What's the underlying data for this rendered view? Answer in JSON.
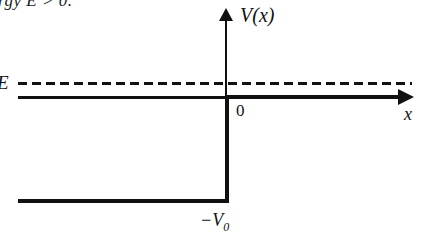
{
  "figure": {
    "caption_fragment": "rgy E > 0.",
    "labels": {
      "y_axis": "V(x)",
      "x_axis": "x",
      "origin": "0",
      "energy": "E",
      "well_depth_prefix": "−V",
      "well_depth_subscript": "0"
    },
    "colors": {
      "ink": "#111111",
      "background": "#ffffff"
    }
  },
  "chart_data": {
    "type": "line",
    "title": "",
    "subtitle": "",
    "xlabel": "x",
    "ylabel": "V(x)",
    "xlim": [
      -1.0,
      0.9
    ],
    "ylim": [
      -1.25,
      0.45
    ],
    "grid": false,
    "legend": null,
    "annotations": [
      {
        "text": "V(x)",
        "role": "y-axis-label",
        "x": 0.08,
        "y": 0.42
      },
      {
        "text": "x",
        "role": "x-axis-label",
        "x": 0.87,
        "y": -0.09
      },
      {
        "text": "0",
        "role": "origin-tick",
        "x": 0.05,
        "y": -0.07
      },
      {
        "text": "E",
        "role": "energy-level-label",
        "x": -1.0,
        "y": 0.16
      },
      {
        "text": "−V₀",
        "role": "well-depth-label",
        "x": -0.12,
        "y": -1.18
      }
    ],
    "series": [
      {
        "name": "V(x)",
        "style": "solid",
        "comment": "finite square step / potential drop at x = 0",
        "x": [
          -1.0,
          0.0,
          0.0,
          0.85
        ],
        "values": [
          -1.0,
          -1.0,
          0.0,
          0.0
        ]
      },
      {
        "name": "E",
        "style": "dashed",
        "comment": "constant total energy level above V = 0",
        "x": [
          -1.0,
          0.85
        ],
        "values": [
          0.14,
          0.14
        ]
      }
    ]
  }
}
